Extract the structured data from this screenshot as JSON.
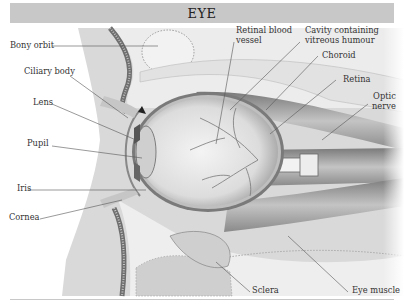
{
  "title": "EYE",
  "colors": {
    "title_bar": "#c8c8c8",
    "label_text": "#333333",
    "leader_line": "#555555",
    "skin": "#d9d9d9",
    "bone": "#8a8a8a",
    "eyeball": "#e6e6e6",
    "muscle": "#a6a6a6"
  },
  "labels": {
    "bony_orbit": "Bony orbit",
    "ciliary_body": "Ciliary body",
    "lens": "Lens",
    "pupil": "Pupil",
    "iris": "Iris",
    "cornea": "Cornea",
    "retinal_vessel_1": "Retinal blood",
    "retinal_vessel_2": "vessel",
    "cavity_1": "Cavity containing",
    "cavity_2": "vitreous humour",
    "choroid": "Choroid",
    "retina": "Retina",
    "optic_nerve_1": "Optic",
    "optic_nerve_2": "nerve",
    "sclera": "Sclera",
    "eye_muscle": "Eye muscle"
  }
}
